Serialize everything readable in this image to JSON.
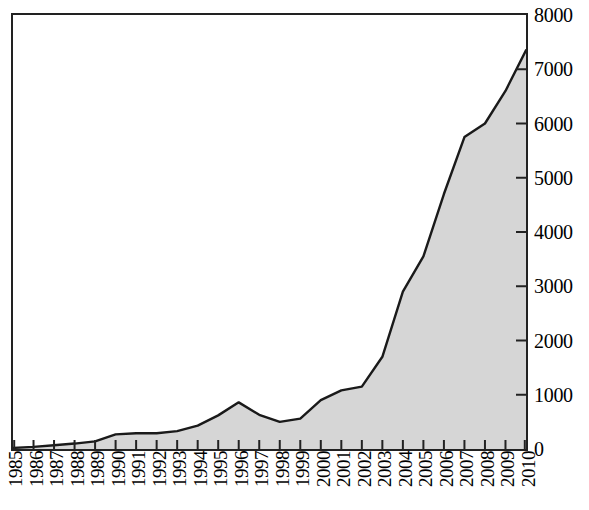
{
  "chart_data": {
    "type": "area",
    "title": "",
    "subtitle": "",
    "xlabel": "",
    "ylabel": "",
    "categories": [
      "1985",
      "1986",
      "1987",
      "1988",
      "1989",
      "1990",
      "1991",
      "1992",
      "1993",
      "1994",
      "1995",
      "1996",
      "1997",
      "1998",
      "1999",
      "2000",
      "2001",
      "2002",
      "2003",
      "2004",
      "2005",
      "2006",
      "2007",
      "2008",
      "2009",
      "2010"
    ],
    "values": [
      20,
      40,
      70,
      100,
      140,
      270,
      290,
      290,
      330,
      430,
      620,
      860,
      630,
      500,
      560,
      900,
      1080,
      1150,
      1700,
      2900,
      3550,
      4700,
      5750,
      6000,
      6600,
      7350
    ],
    "series": [
      {
        "name": "series-1",
        "values": [
          20,
          40,
          70,
          100,
          140,
          270,
          290,
          290,
          330,
          430,
          620,
          860,
          630,
          500,
          560,
          900,
          1080,
          1150,
          1700,
          2900,
          3550,
          4700,
          5750,
          6000,
          6600,
          7350
        ]
      }
    ],
    "ylim": [
      0,
      8000
    ],
    "y_ticks": [
      0,
      1000,
      2000,
      3000,
      4000,
      5000,
      6000,
      7000,
      8000
    ],
    "y_tick_labels": [
      "0",
      "1000",
      "2000",
      "3000",
      "4000",
      "5000",
      "6000",
      "7000",
      "8000"
    ],
    "y_axis_position": "right",
    "x_axis_position": "bottom",
    "x_tick_rotation": -90,
    "grid": false,
    "legend": false,
    "legend_position": "none",
    "fill_color": "#d6d6d6",
    "line_color": "#1a1a1a",
    "frame_color": "#222222",
    "background_color": "#ffffff"
  }
}
